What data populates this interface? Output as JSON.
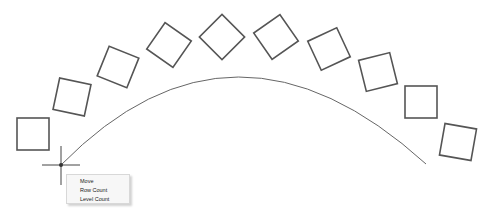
{
  "canvas": {
    "background": "#ffffff",
    "stroke_color": "#555555",
    "arc_color": "#666666",
    "arc": {
      "start": [
        61,
        165
      ],
      "control_top_y": 77,
      "end": [
        426,
        164
      ]
    },
    "crosshair": {
      "center": [
        61,
        165
      ],
      "h_extent": [
        42,
        80
      ],
      "v_extent": [
        146,
        185
      ]
    },
    "squares": [
      {
        "cx": 33,
        "cy": 134,
        "size": 32,
        "rotation": 0
      },
      {
        "cx": 72,
        "cy": 97,
        "size": 32,
        "rotation": 12
      },
      {
        "cx": 118,
        "cy": 67,
        "size": 32,
        "rotation": 22
      },
      {
        "cx": 169,
        "cy": 45,
        "size": 32,
        "rotation": 35
      },
      {
        "cx": 222,
        "cy": 37,
        "size": 32,
        "rotation": 45
      },
      {
        "cx": 276,
        "cy": 37,
        "size": 32,
        "rotation": -35
      },
      {
        "cx": 329,
        "cy": 49,
        "size": 32,
        "rotation": -25
      },
      {
        "cx": 378,
        "cy": 72,
        "size": 32,
        "rotation": -14
      },
      {
        "cx": 421,
        "cy": 102,
        "size": 32,
        "rotation": 0
      },
      {
        "cx": 458,
        "cy": 142,
        "size": 32,
        "rotation": 10
      }
    ]
  },
  "context_menu": {
    "items": [
      {
        "label": "Move"
      },
      {
        "label": "Row Count"
      },
      {
        "label": "Level Count"
      }
    ]
  }
}
